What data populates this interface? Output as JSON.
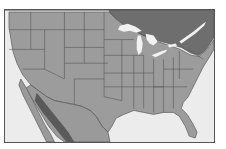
{
  "map": {
    "title": "",
    "region": "United States (contiguous), southern Canada, northern Mexico",
    "style": "grayscale political map with state boundaries",
    "colors": {
      "ocean": "#ececec",
      "usa_land": "#9c9c9c",
      "canada_land": "#6e6e6e",
      "mexico_land": "#9a9a9a",
      "mexico_highlands": "#5a5a5a",
      "lakes": "#f2f2f2",
      "borders": "#4a4a4a",
      "frame": "#555555"
    },
    "features": [
      {
        "name": "Great Lakes"
      },
      {
        "name": "Florida"
      },
      {
        "name": "Gulf of Mexico"
      },
      {
        "name": "Baja California"
      }
    ]
  }
}
